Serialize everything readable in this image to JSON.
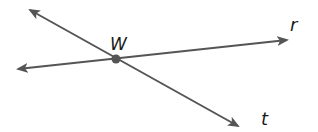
{
  "diagram": {
    "type": "geometry-lines",
    "stroke_color": "#555555",
    "point": {
      "label": "W",
      "x": 116,
      "y": 59
    },
    "lines": [
      {
        "name": "t",
        "label": "t",
        "start": [
          30,
          10
        ],
        "end": [
          238,
          126
        ],
        "arrows": "both",
        "label_pos": [
          262,
          124
        ]
      },
      {
        "name": "r",
        "label": "r",
        "start": [
          18,
          69
        ],
        "end": [
          287,
          40
        ],
        "arrows": "both",
        "label_pos": [
          292,
          30
        ]
      }
    ],
    "point_label_pos": [
      110,
      50
    ]
  }
}
